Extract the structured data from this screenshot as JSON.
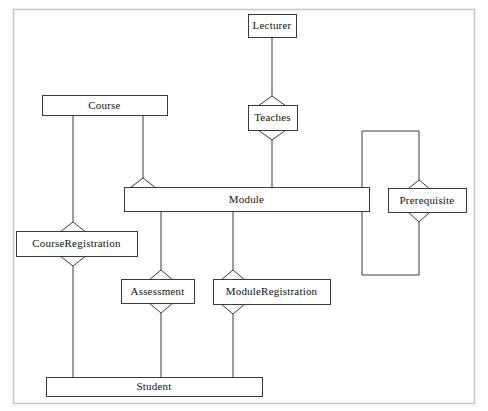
{
  "diagram": {
    "type": "uml-class-diagram",
    "title": "",
    "frame": {
      "x": 13,
      "y": 9,
      "width": 462,
      "height": 395,
      "border_color": "#c9c9c9"
    },
    "style": {
      "line_color": "#3a3a3a",
      "box_fill": "#ffffff",
      "box_border": "#3a3a3a",
      "background": "#fefefe",
      "line_width": 1
    },
    "entities": [
      {
        "id": "lecturer",
        "label": "Lecturer",
        "x": 248,
        "y": 14,
        "width": 48,
        "height": 23
      },
      {
        "id": "teaches",
        "label": "Teaches",
        "x": 248,
        "y": 105,
        "width": 49,
        "height": 25
      },
      {
        "id": "course",
        "label": "Course",
        "x": 42,
        "y": 95,
        "width": 125,
        "height": 20
      },
      {
        "id": "module",
        "label": "Module",
        "x": 124,
        "y": 187,
        "width": 245,
        "height": 24
      },
      {
        "id": "prerequisite",
        "label": "Prerequisite",
        "x": 388,
        "y": 188,
        "width": 78,
        "height": 24
      },
      {
        "id": "course-registration",
        "label": "CourseRegistration",
        "x": 16,
        "y": 231,
        "width": 121,
        "height": 25
      },
      {
        "id": "assessment",
        "label": "Assessment",
        "x": 121,
        "y": 279,
        "width": 73,
        "height": 24
      },
      {
        "id": "module-registration",
        "label": "ModuleRegistration",
        "x": 213,
        "y": 279,
        "width": 117,
        "height": 25
      },
      {
        "id": "student",
        "label": "Student",
        "x": 46,
        "y": 377,
        "width": 216,
        "height": 19
      }
    ],
    "relationships": [
      {
        "id": "lecturer-teaches",
        "from": "lecturer",
        "to": "teaches",
        "marker": "aggregation-diamond"
      },
      {
        "id": "teaches-module",
        "from": "teaches",
        "to": "module",
        "marker": "aggregation-diamond"
      },
      {
        "id": "course-courseregistration",
        "from": "course",
        "to": "course-registration",
        "marker": "aggregation-diamond"
      },
      {
        "id": "course-module",
        "from": "course",
        "to": "module",
        "marker": "aggregation-triangle"
      },
      {
        "id": "module-assessment",
        "from": "module",
        "to": "assessment",
        "marker": "aggregation-diamond"
      },
      {
        "id": "module-moduleregistration",
        "from": "module",
        "to": "module-registration",
        "marker": "aggregation-diamond"
      },
      {
        "id": "module-prerequisite",
        "from": "module",
        "to": "prerequisite",
        "marker": "aggregation-diamond-loop"
      },
      {
        "id": "courseregistration-student",
        "from": "course-registration",
        "to": "student",
        "marker": "plain"
      },
      {
        "id": "assessment-student",
        "from": "assessment",
        "to": "student",
        "marker": "plain"
      },
      {
        "id": "moduleregistration-student",
        "from": "module-registration",
        "to": "student",
        "marker": "plain"
      }
    ]
  }
}
